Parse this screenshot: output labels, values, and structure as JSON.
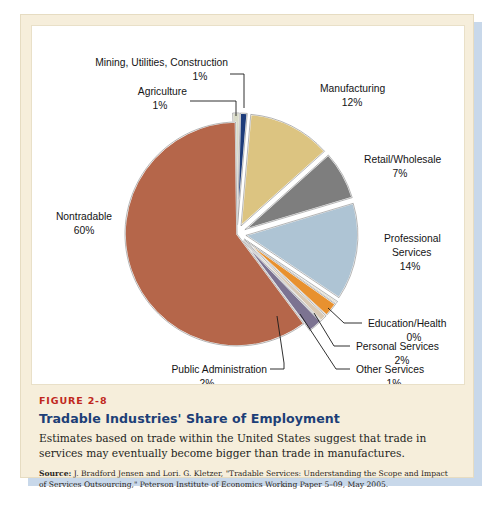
{
  "figure": {
    "number_label": "FIGURE 2-8",
    "title": "Tradable Industries' Share of Employment",
    "description": "Estimates based on trade within the United States suggest that trade in services may eventually become bigger than trade in manufactures.",
    "source_prefix": "Source:",
    "source_text": " J. Bradford Jensen and Lori. G. Kletzer, \"Tradable Services: Understanding the Scope and Impact of Services Outsourcing,\" Peterson Institute of Economics Working Paper 5–09, May 2005."
  },
  "chart_data": {
    "type": "pie",
    "title": "Tradable Industries' Share of Employment",
    "units": "percent of employment",
    "total": 100,
    "categories": [
      "Agriculture",
      "Mining, Utilities, Construction",
      "Manufacturing",
      "Retail/Wholesale",
      "Professional Services",
      "Education/Health",
      "Personal Services",
      "Other Services",
      "Public Administration",
      "Nontradable"
    ],
    "values": [
      1,
      1,
      12,
      7,
      14,
      0,
      2,
      1,
      2,
      60
    ],
    "value_labels": [
      "1%",
      "1%",
      "12%",
      "7%",
      "14%",
      "0%",
      "2%",
      "1%",
      "2%",
      "60%"
    ],
    "colors": [
      "#d9dbc8",
      "#1c3b7a",
      "#dcc481",
      "#7e7e7e",
      "#aec4d4",
      "#e4e0cf",
      "#e8912f",
      "#d9c9b4",
      "#7c7391",
      "#b5664a"
    ],
    "exploded": [
      true,
      true,
      true,
      true,
      true,
      true,
      true,
      true,
      true,
      false
    ],
    "legend": "none",
    "labels_position": "outside-with-leader-lines"
  },
  "slice_labels": [
    {
      "name": "Mining, Utilities, Construction",
      "value_label": "1%"
    },
    {
      "name": "Agriculture",
      "value_label": "1%"
    },
    {
      "name": "Manufacturing",
      "value_label": "12%"
    },
    {
      "name": "Retail/Wholesale",
      "value_label": "7%"
    },
    {
      "name": "Professional Services",
      "value_label": "14%"
    },
    {
      "name": "Education/Health",
      "value_label": "0%"
    },
    {
      "name": "Personal Services",
      "value_label": "2%"
    },
    {
      "name": "Other Services",
      "value_label": "1%"
    },
    {
      "name": "Public Administration",
      "value_label": "2%"
    },
    {
      "name": "Nontradable",
      "value_label": "60%"
    }
  ],
  "label_lines": {
    "mining_l1": "Mining, Utilities, Construction",
    "mining_l2": "1%",
    "agriculture_l1": "Agriculture",
    "agriculture_l2": "1%",
    "manufacturing_l1": "Manufacturing",
    "manufacturing_l2": "12%",
    "retail_l1": "Retail/Wholesale",
    "retail_l2": "7%",
    "professional_l1": "Professional",
    "professional_l2": "Services",
    "professional_l3": "14%",
    "education_l1": "Education/Health",
    "education_l2": "0%",
    "personal_l1": "Personal Services",
    "personal_l2": "2%",
    "other_l1": "Other Services",
    "other_l2": "1%",
    "public_l1": "Public Administration",
    "public_l2": "2%",
    "nontradable_l1": "Nontradable",
    "nontradable_l2": "60%"
  }
}
